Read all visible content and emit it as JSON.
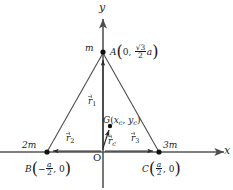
{
  "figure": {
    "kind": "coordinate-geometry-diagram",
    "background": "#ffffff",
    "stroke_color": "#4d4d4d",
    "line_color": "#555555",
    "text_color": "#1a1a1a"
  },
  "axes": {
    "x_label": "x",
    "y_label": "y",
    "origin_label": "O",
    "x_axis": {
      "x1": 0,
      "y1": 152,
      "x2": 228,
      "y2": 152,
      "arrow": "right"
    },
    "y_axis": {
      "x1": 103,
      "y1": 185,
      "x2": 103,
      "y2": 16,
      "arrow": "up"
    }
  },
  "points": [
    {
      "id": "A",
      "name": "vertex-a",
      "mass_label": "m",
      "label_prefix": "A",
      "coord_x": "0",
      "coord_y_numerator": "√3",
      "coord_y_denominator": "2",
      "coord_y_symbol": "a",
      "px": 103,
      "py": 52
    },
    {
      "id": "B",
      "name": "vertex-b",
      "mass_label": "2m",
      "label_prefix": "B",
      "coord_x_sign": "−",
      "coord_x_numerator": "a",
      "coord_x_denominator": "2",
      "coord_y": "0",
      "px": 47,
      "py": 152
    },
    {
      "id": "C",
      "name": "vertex-c",
      "mass_label": "3m",
      "label_prefix": "C",
      "coord_x_numerator": "a",
      "coord_x_denominator": "2",
      "coord_y": "0",
      "px": 159,
      "py": 152
    },
    {
      "id": "G",
      "name": "centroid-g",
      "label_prefix": "G",
      "coord_x": "x",
      "coord_x_sub": "c",
      "coord_y": "y",
      "coord_y_sub": "c",
      "px": 110,
      "py": 126
    }
  ],
  "vectors": [
    {
      "id": "r1",
      "name": "vector-r1",
      "symbol": "r",
      "sub": "1",
      "label_x": 88,
      "label_y": 96
    },
    {
      "id": "r2",
      "name": "vector-r2",
      "symbol": "r",
      "sub": "2",
      "label_x": 66,
      "label_y": 137
    },
    {
      "id": "r3",
      "name": "vector-r3",
      "symbol": "r",
      "sub": "3",
      "label_x": 131,
      "label_y": 137
    },
    {
      "id": "rc",
      "name": "vector-rc",
      "symbol": "r",
      "sub": "c",
      "label_x": 110,
      "label_y": 140
    }
  ],
  "triangle": {
    "name": "triangle-abc",
    "vertices": "A(0, √3/2 a), B(−a/2, 0), C(a/2, 0)"
  }
}
